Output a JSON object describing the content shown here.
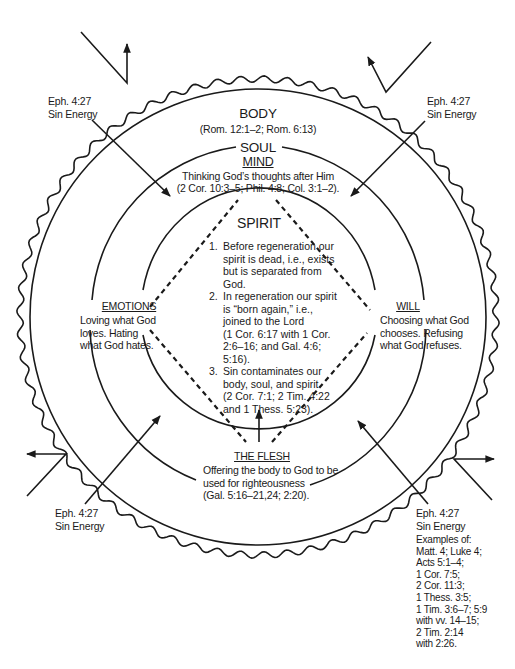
{
  "diagram": {
    "colors": {
      "ink": "#1a1a1a",
      "background": "#ffffff"
    },
    "body": {
      "label": "BODY",
      "reference": "(Rom. 12:1–2; Rom. 6:13)"
    },
    "soul": {
      "label": "SOUL",
      "mind": {
        "label": "MIND",
        "description": "Thinking God’s thoughts after Him",
        "reference": "(2 Cor. 10:3–5; Phil. 4:8; Col. 3:1–2)."
      },
      "emotions": {
        "label": "EMOTIONS",
        "lines": [
          "Loving what God",
          "loves. Hating",
          "what God hates."
        ]
      },
      "will": {
        "label": "WILL",
        "lines": [
          "Choosing what God",
          "chooses. Refusing",
          "what God refuses."
        ]
      },
      "flesh": {
        "label": "THE FLESH",
        "lines": [
          "Offering the body to God to be",
          "used for righteousness",
          "(Gal. 5:16–21,24; 2:20)."
        ]
      }
    },
    "spirit": {
      "label": "SPIRIT",
      "points": [
        {
          "num": "1.",
          "lines": [
            "Before regeneration our",
            "spirit is dead, i.e., exists",
            "but is separated from",
            "God."
          ]
        },
        {
          "num": "2.",
          "lines": [
            "In regeneration our spirit",
            "is “born again,” i.e.,",
            "joined to the Lord",
            "(1 Cor. 6:17 with 1 Cor.",
            "2:6–16; and Gal. 4:6;",
            "5:16)."
          ]
        },
        {
          "num": "3.",
          "lines": [
            "Sin contaminates our",
            "body, soul, and spirit",
            "(2 Cor. 7:1; 2 Tim. 4:22",
            "and 1 Thess. 5:23)."
          ]
        }
      ]
    },
    "sin_energy_labels": [
      {
        "position": "top-left",
        "lines": [
          "Eph. 4:27",
          "Sin Energy"
        ]
      },
      {
        "position": "top-right",
        "lines": [
          "Eph. 4:27",
          "Sin Energy"
        ]
      },
      {
        "position": "bottom-left",
        "lines": [
          "Eph. 4:27",
          "Sin Energy"
        ]
      },
      {
        "position": "bottom-right",
        "lines": [
          "Eph. 4:27",
          "Sin Energy"
        ]
      }
    ],
    "examples": {
      "lines": [
        "Examples of:",
        "Matt. 4; Luke 4;",
        "Acts 5:1–4;",
        "1 Cor. 7:5;",
        "2 Cor. 11:3;",
        "1 Thess. 3:5;",
        "1 Tim. 3:6–7; 5:9",
        "with vv. 14–15;",
        "2 Tim. 2:14",
        "with 2:26."
      ]
    }
  }
}
